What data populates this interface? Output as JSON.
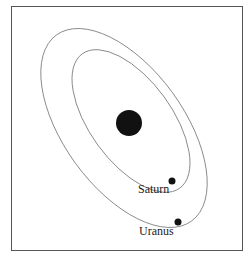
{
  "diagram": {
    "type": "orbital-diagram",
    "central_body": {
      "name": "sun",
      "fill": "#111111"
    },
    "orbits": [
      {
        "name": "Saturn-orbit",
        "stroke": "#777777"
      },
      {
        "name": "Uranus-orbit",
        "stroke": "#777777"
      }
    ],
    "planets": [
      {
        "name": "Saturn",
        "label": "Saturn"
      },
      {
        "name": "Uranus",
        "label": "Uranus"
      }
    ]
  }
}
